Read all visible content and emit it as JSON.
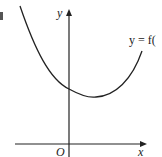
{
  "diagram": {
    "curve_label": "y = f(",
    "y_axis_label": "y",
    "x_axis_label": "x",
    "origin_label": "O",
    "colors": {
      "stroke": "#222222",
      "background": "#ffffff",
      "marker": "#555555"
    },
    "curve": {
      "type": "parabola-like",
      "description": "U-shaped curve with positive y-intercept and minimum to the right of the y-axis, above the x-axis"
    }
  }
}
